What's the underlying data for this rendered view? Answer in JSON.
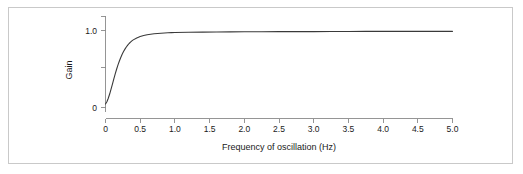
{
  "figure": {
    "background_color": "#ffffff",
    "frame_color": "#c9c9c9",
    "axis_color": "#8a8a8a",
    "curve_color": "#3a3a3a"
  },
  "chart_data": {
    "type": "line",
    "title": "",
    "subtitle": "",
    "xlabel": "Frequency of oscillation (Hz)",
    "ylabel": "Gain",
    "xlim": [
      0,
      5
    ],
    "ylim": [
      0,
      1.15
    ],
    "grid": false,
    "legend": "none",
    "xticks": [
      0,
      0.5,
      1,
      1.5,
      2,
      2.5,
      3,
      3.5,
      4,
      4.5,
      5
    ],
    "xtick_labels": [
      "0",
      "0.5",
      "1.0",
      "1.5",
      "2.0",
      "2.5",
      "3.0",
      "3.5",
      "4.0",
      "4.5",
      "5.0"
    ],
    "yticks": [
      0,
      0.5,
      1
    ],
    "ytick_labels": [
      "0",
      "",
      "1.0"
    ],
    "ytick_labels_shown": [
      "0",
      "1.0"
    ],
    "y_minor_ticks": [
      0.5,
      1.15
    ],
    "series": [
      {
        "name": "Gain",
        "x": [
          0.0,
          0.02,
          0.04,
          0.06,
          0.08,
          0.1,
          0.12,
          0.14,
          0.16,
          0.18,
          0.2,
          0.22,
          0.24,
          0.26,
          0.28,
          0.3,
          0.32,
          0.34,
          0.36,
          0.38,
          0.4,
          0.45,
          0.5,
          0.55,
          0.6,
          0.65,
          0.7,
          0.75,
          0.8,
          0.85,
          0.9,
          0.95,
          1.0,
          1.2,
          1.4,
          1.6,
          1.8,
          2.0,
          2.25,
          2.5,
          2.75,
          3.0,
          3.25,
          3.5,
          3.75,
          4.0,
          4.25,
          4.5,
          4.75,
          5.0
        ],
        "y": [
          0.045,
          0.075,
          0.12,
          0.175,
          0.238,
          0.305,
          0.372,
          0.437,
          0.497,
          0.553,
          0.604,
          0.65,
          0.691,
          0.727,
          0.758,
          0.786,
          0.81,
          0.831,
          0.849,
          0.865,
          0.878,
          0.903,
          0.921,
          0.934,
          0.944,
          0.951,
          0.957,
          0.962,
          0.965,
          0.968,
          0.97,
          0.972,
          0.974,
          0.977,
          0.979,
          0.981,
          0.982,
          0.983,
          0.984,
          0.985,
          0.986,
          0.986,
          0.987,
          0.987,
          0.988,
          0.988,
          0.988,
          0.989,
          0.989,
          0.989
        ]
      }
    ]
  }
}
